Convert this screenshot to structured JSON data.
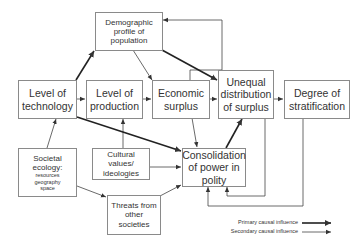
{
  "nodes": {
    "demographic": {
      "lines": [
        "Demographic",
        "profile of",
        "population"
      ]
    },
    "technology": {
      "lines": [
        "Level of",
        "technology"
      ]
    },
    "production": {
      "lines": [
        "Level of",
        "production"
      ]
    },
    "economic": {
      "lines": [
        "Economic",
        "surplus"
      ]
    },
    "unequal": {
      "lines": [
        "Unequal",
        "distribution",
        "of surplus"
      ]
    },
    "stratification": {
      "lines": [
        "Degree of",
        "stratification"
      ]
    },
    "ecology": {
      "lines": [
        "Societal",
        "ecology:",
        "resources",
        "geography",
        "space"
      ]
    },
    "cultural": {
      "lines": [
        "Cultural",
        "values/",
        "ideologies"
      ]
    },
    "consolidation": {
      "lines": [
        "Consolidation",
        "of power in",
        "polity"
      ]
    },
    "threats": {
      "lines": [
        "Threats from",
        "other",
        "societies"
      ]
    }
  },
  "legend": {
    "primary": "Primary causal influence",
    "secondary": "Secondary causal influence"
  },
  "colors": {
    "line": "#333333",
    "box_border": "#8a8a8a"
  }
}
